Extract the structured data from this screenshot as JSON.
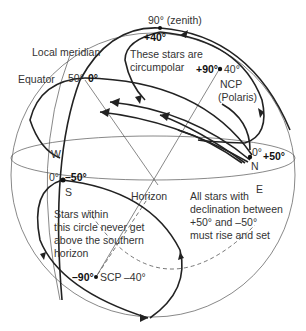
{
  "diagram": {
    "labels": {
      "zenith": "90° (zenith)",
      "local_meridian": "Local meridian",
      "equator": "Equator",
      "equator_alt": "50°",
      "equator_dec": "0°",
      "circumpolar_top_dec": "+40°",
      "circumpolar_note_line1": "These stars are",
      "circumpolar_note_line2": "circumpolar",
      "ncp_dec": "+90°",
      "ncp_alt": "40°",
      "ncp": "NCP",
      "polaris": "(Polaris)",
      "west": "W",
      "north": "N",
      "north_alt": "0°",
      "north_dec": "+50°",
      "east": "E",
      "south": "S",
      "south_alt": "0°",
      "south_dec": "–50°",
      "horizon": "Horizon",
      "rise_set_note_line1": "All stars with",
      "rise_set_note_line2": "declination between",
      "rise_set_note_line3": "+50° and –50°",
      "rise_set_note_line4": "must rise and set",
      "south_note_line1": "Stars within",
      "south_note_line2": "this circle never get",
      "south_note_line3": "above the southern",
      "south_note_line4": "horizon",
      "scp_dec": "–90°",
      "scp": "SCP",
      "scp_alt": "–40°"
    }
  }
}
